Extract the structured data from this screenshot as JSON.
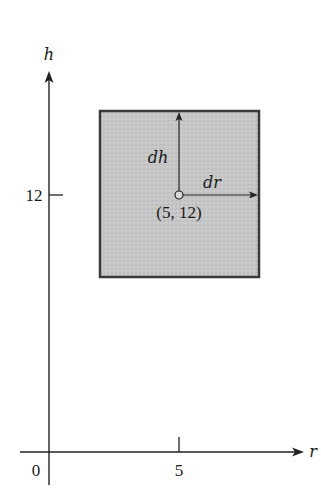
{
  "diagram": {
    "axes": {
      "vertical_label": "h",
      "horizontal_label": "r",
      "origin_label": "0",
      "x_tick_label": "5",
      "y_tick_label": "12"
    },
    "region": {
      "point_label": "(5, 12)",
      "dh_label": "dh",
      "dr_label": "dr",
      "fill_color": "#c9c9c9",
      "border_color": "#3a3a3a"
    }
  }
}
